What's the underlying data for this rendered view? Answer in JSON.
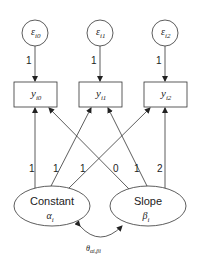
{
  "diagram": {
    "type": "latent growth curve model",
    "errors": [
      {
        "symbol": "ε",
        "subscript": "i0"
      },
      {
        "symbol": "ε",
        "subscript": "i1"
      },
      {
        "symbol": "ε",
        "subscript": "i2"
      }
    ],
    "error_loadings": [
      "1",
      "1",
      "1"
    ],
    "observed": [
      {
        "symbol": "y",
        "subscript": "i0"
      },
      {
        "symbol": "y",
        "subscript": "i1"
      },
      {
        "symbol": "y",
        "subscript": "i2"
      }
    ],
    "latents": [
      {
        "name": "Constant",
        "symbol": "α",
        "subscript": "i"
      },
      {
        "name": "Slope",
        "symbol": "β",
        "subscript": "i"
      }
    ],
    "factor_loadings": {
      "constant": [
        "1",
        "1",
        "1"
      ],
      "slope": [
        "0",
        "1",
        "2"
      ]
    },
    "loading_labels_order": [
      "1",
      "1",
      "1",
      "0",
      "1",
      "2"
    ],
    "covariance": {
      "symbol": "θ",
      "subscript": "αi,βi"
    }
  }
}
